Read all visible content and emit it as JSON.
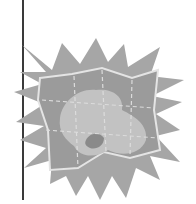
{
  "image": {
    "description": "Grayscale clip-art icon of a folded map over a starburst",
    "icon": "folded-map-starburst-icon",
    "colors": {
      "background": "#ffffff",
      "divider_line": "#3a3a3a",
      "starburst": "#a6a6a6",
      "map_fill": "#9b9b9b",
      "map_border": "#e4e4e4",
      "landmass": "#c2c2c2",
      "landmass_dark": "#8a8a8a",
      "fold_lines": "#dcdcdc"
    }
  }
}
